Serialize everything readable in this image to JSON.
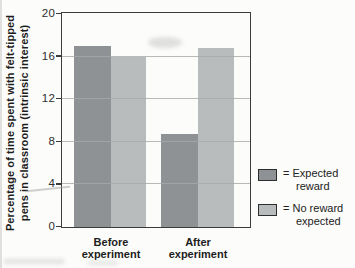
{
  "chart_data": {
    "type": "bar",
    "title": "",
    "ylabel": "Percentage of time spent with felt-tipped pens in classroom (intrinsic interest)",
    "ylabel_lines": [
      "Percentage of time spent with felt-tipped",
      "pens in classroom (intrinsic interest)"
    ],
    "categories": [
      "Before experiment",
      "After experiment"
    ],
    "category_lines": [
      [
        "Before",
        "experiment"
      ],
      [
        "After",
        "experiment"
      ]
    ],
    "ylim": [
      0,
      20
    ],
    "yticks": [
      0,
      4,
      8,
      12,
      16,
      20
    ],
    "grid": true,
    "series": [
      {
        "name": "Expected reward",
        "color": "#8f9294",
        "values": [
          17,
          8.7
        ]
      },
      {
        "name": "No reward expected",
        "color": "#b9bcbd",
        "values": [
          16,
          16.8
        ]
      }
    ],
    "legend_position": "right",
    "legend": [
      {
        "swatch_color": "#8f9294",
        "label_lines": [
          "= Expected",
          "reward"
        ]
      },
      {
        "swatch_color": "#b9bcbd",
        "label_lines": [
          "= No reward",
          "expected"
        ]
      }
    ]
  },
  "colors": {
    "background": "#fcfcfa",
    "frame": "#3b3b3b",
    "grid": "#a8a8a8",
    "text": "#2a2a2a"
  }
}
